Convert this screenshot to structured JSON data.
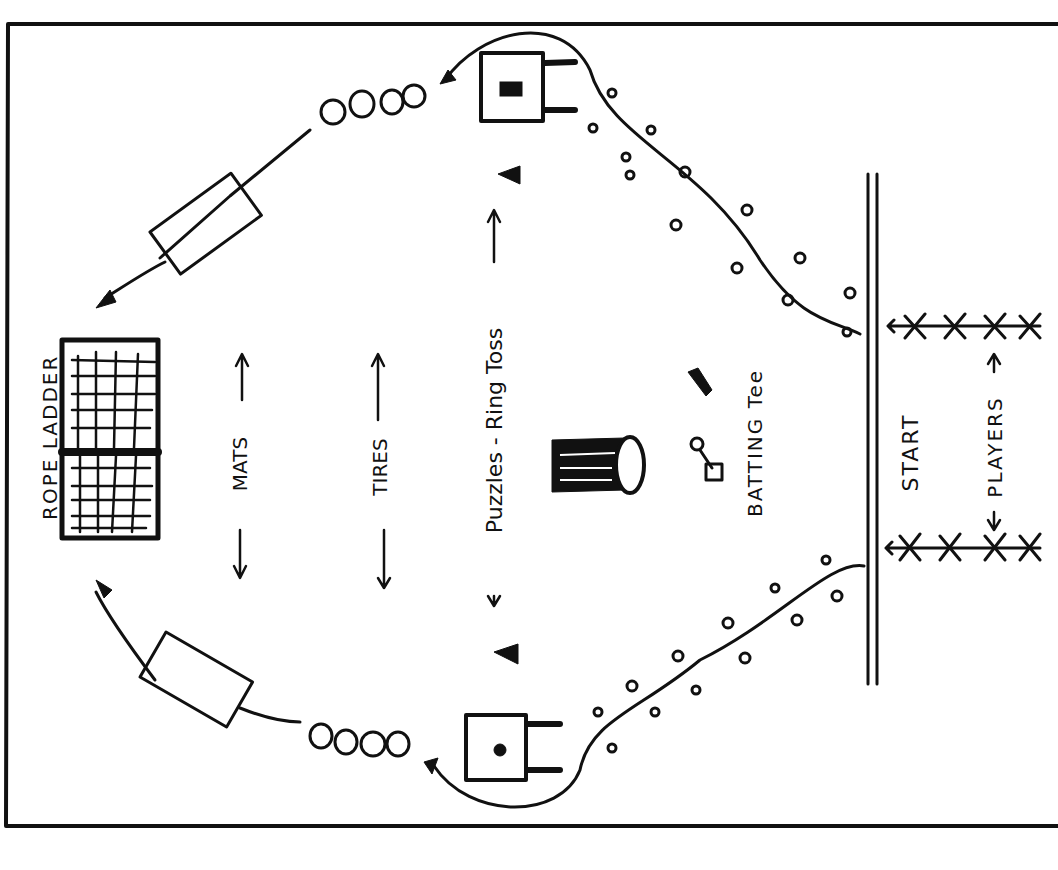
{
  "diagram": {
    "stations": [
      {
        "id": "rope-ladder",
        "label": "ROPE LADDER"
      },
      {
        "id": "mats",
        "label": "MATS"
      },
      {
        "id": "tires",
        "label": "TIRES"
      },
      {
        "id": "puzzles-ring-toss",
        "label": "Puzzles - Ring Toss"
      },
      {
        "id": "batting-tee",
        "label": "BATTING Tee"
      },
      {
        "id": "start",
        "label": "START"
      },
      {
        "id": "players",
        "label": "PLAYERS"
      }
    ],
    "colors": {
      "ink": "#111111",
      "paper": "#ffffff"
    }
  }
}
